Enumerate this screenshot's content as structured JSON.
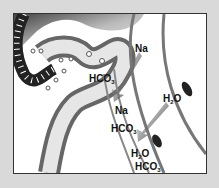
{
  "diagram": {
    "labels": [
      {
        "id": "na-1",
        "text": "Na",
        "sub": "",
        "x": 134,
        "y": 43
      },
      {
        "id": "hco3-1",
        "text": "HCO",
        "sub": "3",
        "x": 88,
        "y": 73
      },
      {
        "id": "na-2",
        "text": "Na",
        "sub": "",
        "x": 114,
        "y": 105
      },
      {
        "id": "h2o-1",
        "text": "H",
        "sub": "2",
        "suffix": "O",
        "x": 162,
        "y": 93
      },
      {
        "id": "hco3-2",
        "text": "HCO",
        "sub": "3",
        "x": 110,
        "y": 123
      },
      {
        "id": "h2o-2",
        "text": "H",
        "sub": "2",
        "suffix": "O",
        "x": 130,
        "y": 148
      },
      {
        "id": "hco3-3",
        "text": "HCO",
        "sub": "3",
        "x": 134,
        "y": 162
      }
    ],
    "colors": {
      "background": "#d9d9d9",
      "frame_border": "#333333",
      "tubule_dark": "#555555",
      "tubule_light": "#f2f2f2",
      "arrow": "#2a2a2a"
    }
  }
}
